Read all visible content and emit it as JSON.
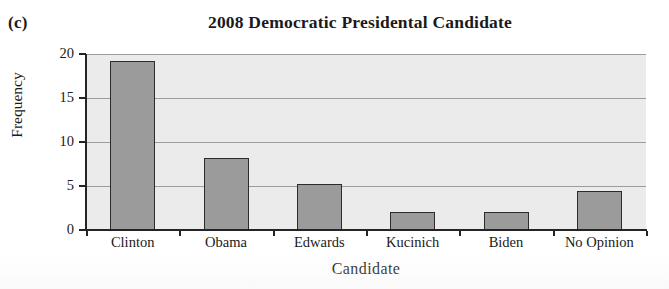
{
  "panel": {
    "label": "(c)"
  },
  "chart_data": {
    "type": "bar",
    "title": "2008 Democratic Presidental Candidate",
    "xlabel": "Candidate",
    "ylabel": "Frequency",
    "categories": [
      "Clinton",
      "Obama",
      "Edwards",
      "Kucinich",
      "Biden",
      "No Opinion"
    ],
    "values": [
      19.2,
      8.2,
      5.2,
      2.1,
      2.1,
      4.4
    ],
    "ylim": [
      0,
      20
    ],
    "yticks": [
      0,
      5,
      10,
      15,
      20
    ],
    "ytick_labels": [
      "0",
      "5",
      "10",
      "15",
      "20"
    ],
    "grid": true,
    "grid_axis": "y",
    "legend": "none",
    "bar_fill_color": "#9b9b9b",
    "bar_edge_color": "#2c2c2c",
    "plot_background_color": "#ebebeb",
    "gridline_color": "#9d9d9d",
    "axis_color": "#242424"
  }
}
